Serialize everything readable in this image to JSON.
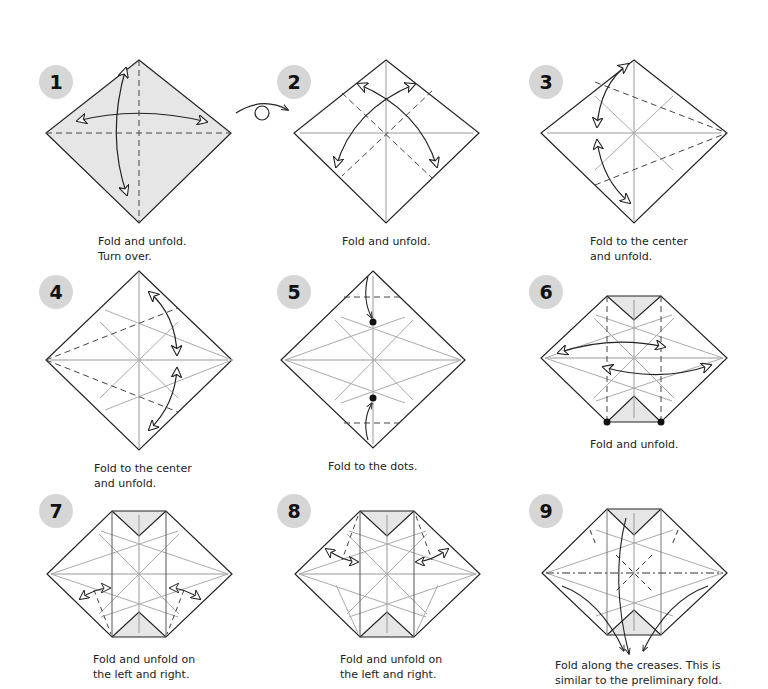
{
  "colors": {
    "paper_shaded": "#e8e8e8",
    "line": "#222222",
    "crease": "#9a9a9a",
    "badge": "#d6d6d6"
  },
  "steps": [
    {
      "number": "1",
      "caption": "Fold and unfold.\nTurn over.",
      "symbols": [
        "valley-fold-dashed",
        "two-way-arrow",
        "turn-over-arrow"
      ]
    },
    {
      "number": "2",
      "caption": "Fold and unfold.",
      "symbols": [
        "valley-fold-dashed",
        "two-way-arrow"
      ]
    },
    {
      "number": "3",
      "caption": "Fold to the center\nand unfold.",
      "symbols": [
        "valley-fold-dashed",
        "two-way-arrow"
      ]
    },
    {
      "number": "4",
      "caption": "Fold to the center\nand unfold.",
      "symbols": [
        "valley-fold-dashed",
        "two-way-arrow"
      ]
    },
    {
      "number": "5",
      "caption": "Fold to the dots.",
      "symbols": [
        "valley-fold-dashed",
        "fold-arrow",
        "reference-dot"
      ]
    },
    {
      "number": "6",
      "caption": "Fold and unfold.",
      "symbols": [
        "valley-fold-dashed",
        "two-way-arrow",
        "reference-dot"
      ]
    },
    {
      "number": "7",
      "caption": "Fold and unfold on\nthe left and right.",
      "symbols": [
        "valley-fold-dashed",
        "two-way-arrow"
      ]
    },
    {
      "number": "8",
      "caption": "Fold and unfold on\nthe left and right.",
      "symbols": [
        "valley-fold-dashed",
        "two-way-arrow"
      ]
    },
    {
      "number": "9",
      "caption": "Fold along the creases. This is\nsimilar to the preliminary fold.",
      "symbols": [
        "mountain-fold-dash-dot",
        "valley-fold-dashed",
        "fold-arrow"
      ]
    }
  ]
}
